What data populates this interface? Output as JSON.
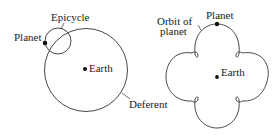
{
  "left_diagram": {
    "labels": {
      "epicycle": "Epicycle",
      "planet": "Planet",
      "earth": "Earth",
      "deferent": "Deferent"
    }
  },
  "right_diagram": {
    "labels": {
      "orbit": "Orbit of",
      "orbit2": "planet",
      "planet": "Planet",
      "earth": "Earth"
    }
  },
  "colors": {
    "line": "#333333",
    "dot": "#111111"
  }
}
